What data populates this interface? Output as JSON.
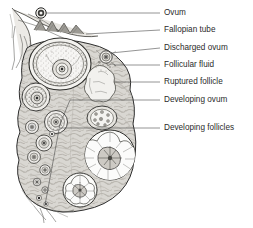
{
  "figure": {
    "background_color": "#ffffff",
    "label_color": "#2b2b2b",
    "leader_color": "#3a3a3a",
    "stroke_color": "#2f2f2f"
  },
  "labels": [
    {
      "id": "ovum",
      "text": "Ovum",
      "text_x": 164,
      "text_y": 13,
      "leader_x1": 106,
      "leader_y1": 13,
      "leader_x2": 160,
      "leader_y2": 13,
      "target_x": 44,
      "target_y": 13
    },
    {
      "id": "fallopian-tube",
      "text": "Fallopian tube",
      "text_x": 164,
      "text_y": 30,
      "leader_x1": 96,
      "leader_y1": 30,
      "leader_x2": 160,
      "leader_y2": 30,
      "target_x": 70,
      "target_y": 28
    },
    {
      "id": "discharged-ovum",
      "text": "Discharged ovum",
      "text_x": 164,
      "text_y": 48,
      "leader_x1": 110,
      "leader_y1": 59,
      "leader_x2": 160,
      "leader_y2": 48,
      "target_x": 106,
      "target_y": 57
    },
    {
      "id": "follicular-fluid",
      "text": "Follicular fluid",
      "text_x": 164,
      "text_y": 65,
      "leader_x1": 104,
      "leader_y1": 65,
      "leader_x2": 160,
      "leader_y2": 65,
      "target_x": 100,
      "target_y": 66
    },
    {
      "id": "ruptured-follicle",
      "text": "Ruptured follicle",
      "text_x": 164,
      "text_y": 82,
      "leader_x1": 96,
      "leader_y1": 82,
      "leader_x2": 160,
      "leader_y2": 82,
      "target_x": 92,
      "target_y": 80
    },
    {
      "id": "developing-ovum",
      "text": "Developing ovum",
      "text_x": 164,
      "text_y": 100,
      "leader_x1": 56,
      "leader_y1": 100,
      "leader_x2": 160,
      "leader_y2": 100,
      "target_x": 56,
      "target_y": 100
    },
    {
      "id": "developing-follicles",
      "text": "Developing follicles",
      "text_x": 164,
      "text_y": 128,
      "leader_x1": 72,
      "leader_y1": 128,
      "leader_x2": 160,
      "leader_y2": 128,
      "target_x": 72,
      "target_y": 128
    }
  ],
  "structures": {
    "ovary_body": "ovary-body-outline",
    "fimbriae": "fallopian-tube-fimbriae",
    "graafian_follicle": "mature-graafian-follicle",
    "ruptured_follicle": "ruptured-follicle-shape",
    "follicular_fluid": "follicular-fluid-spill",
    "discharged_ovum": "discharged-ovum",
    "free_ovum": "free-ovum",
    "corpus_luteum_large": "corpus-luteum-large",
    "corpus_luteum_small": "corpus-luteum-small",
    "corpus_albicans": "corpus-albicans",
    "hilum": "ovary-hilum-vessels",
    "developing_follicle_count": 11
  }
}
